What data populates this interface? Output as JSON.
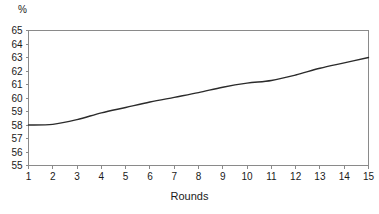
{
  "chart_data": {
    "type": "line",
    "title": "",
    "xlabel": "Rounds",
    "ylabel": "%",
    "ylabel_position": "top-left",
    "x": [
      1,
      2,
      3,
      4,
      5,
      6,
      7,
      8,
      9,
      10,
      11,
      12,
      13,
      14,
      15
    ],
    "xtick_labels": [
      "1",
      "2",
      "3",
      "4",
      "5",
      "6",
      "7",
      "8",
      "9",
      "10",
      "11",
      "12",
      "13",
      "14",
      "15"
    ],
    "ytick_labels": [
      "65",
      "64",
      "63",
      "62",
      "61",
      "60",
      "59",
      "58",
      "57",
      "56",
      "55"
    ],
    "yticks": [
      65,
      64,
      63,
      62,
      61,
      60,
      59,
      58,
      57,
      56,
      55
    ],
    "xlim": [
      1,
      15
    ],
    "ylim": [
      55,
      65
    ],
    "grid": false,
    "legend": false,
    "series": [
      {
        "name": "percent",
        "values": [
          58.0,
          58.05,
          58.4,
          58.9,
          59.3,
          59.7,
          60.05,
          60.4,
          60.8,
          61.1,
          61.3,
          61.7,
          62.2,
          62.6,
          63.0
        ]
      }
    ],
    "line_color": "#2b2b2b",
    "axis_color": "#8a8a8a",
    "background_color": "#ffffff"
  }
}
